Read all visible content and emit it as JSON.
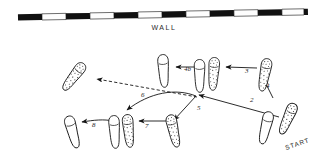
{
  "figure": {
    "title_text": "WALL",
    "start_text": "START",
    "background_color": "#ffffff",
    "ink_color": "#141414"
  },
  "wall": {
    "label": "WALL",
    "segment_count": 12,
    "pattern": [
      "dark",
      "light",
      "dark",
      "light",
      "dark",
      "light",
      "dark",
      "light",
      "dark",
      "light",
      "dark",
      "light"
    ],
    "dark_color": "#111111",
    "light_color": "#fdfdfd"
  },
  "footprints": [
    {
      "id": "start-right",
      "label": "START",
      "side": "right",
      "shading": "stippled",
      "x": 286,
      "y": 118,
      "rotation": 22
    },
    {
      "id": "foot-step1-left",
      "label": "1",
      "side": "left",
      "shading": "plain",
      "x": 265,
      "y": 127,
      "rotation": 14
    },
    {
      "id": "foot-step2-right",
      "label": "2",
      "side": "right",
      "shading": "stippled",
      "x": 264,
      "y": 74,
      "rotation": 10
    },
    {
      "id": "foot-step3-right",
      "label": "3",
      "side": "right",
      "shading": "stippled",
      "x": 213,
      "y": 73,
      "rotation": 2
    },
    {
      "id": "foot-step3-left",
      "label": "3b",
      "side": "left",
      "shading": "plain",
      "x": 199,
      "y": 75,
      "rotation": -2
    },
    {
      "id": "foot-step4-left",
      "label": "4",
      "side": "left",
      "shading": "plain",
      "x": 163,
      "y": 70,
      "rotation": -6
    },
    {
      "id": "foot-step5-right",
      "label": "5",
      "side": "right",
      "shading": "stippled",
      "x": 172,
      "y": 128,
      "rotation": -16
    },
    {
      "id": "foot-step6-right",
      "label": "6",
      "side": "right",
      "shading": "stippled",
      "x": 128,
      "y": 128,
      "rotation": -8
    },
    {
      "id": "foot-step7-left",
      "label": "7",
      "side": "left",
      "shading": "plain",
      "x": 114,
      "y": 130,
      "rotation": -6
    },
    {
      "id": "foot-step8-left",
      "label": "8",
      "side": "left",
      "shading": "plain",
      "x": 72,
      "y": 130,
      "rotation": -18
    },
    {
      "id": "foot-final-left",
      "label": "final",
      "side": "left",
      "shading": "stippled",
      "x": 72,
      "y": 76,
      "rotation": 36
    }
  ],
  "step_labels": [
    {
      "n": "2",
      "x": 250,
      "y": 101
    },
    {
      "n": "3",
      "x": 246,
      "y": 72
    },
    {
      "n": "4",
      "x": 265,
      "y": 86
    },
    {
      "n": "4b",
      "x": 184,
      "y": 70
    },
    {
      "n": "5",
      "x": 198,
      "y": 108
    },
    {
      "n": "6",
      "x": 141,
      "y": 95
    },
    {
      "n": "7",
      "x": 144,
      "y": 127
    },
    {
      "n": "8",
      "x": 92,
      "y": 125
    }
  ],
  "arrows": [
    {
      "id": "arrow-start-to-2",
      "number": "2",
      "style": "solid",
      "from": [
        278,
        118
      ],
      "to": [
        196,
        94
      ]
    },
    {
      "id": "arrow-2-to-3",
      "number": "3",
      "style": "solid",
      "from": [
        256,
        69
      ],
      "to": [
        224,
        68
      ]
    },
    {
      "id": "arrow-3-to-4",
      "number": "4",
      "style": "solid",
      "from": [
        272,
        96
      ],
      "to": [
        262,
        78
      ]
    },
    {
      "id": "arrow-4-to-5",
      "number": "4b",
      "style": "solid",
      "from": [
        196,
        68
      ],
      "to": [
        174,
        68
      ]
    },
    {
      "id": "arrow-5-to-6",
      "number": "5",
      "style": "solid",
      "from": [
        196,
        94
      ],
      "to": [
        172,
        120
      ]
    },
    {
      "id": "arrow-6-to-7",
      "number": "6",
      "style": "solid",
      "from": [
        196,
        94
      ],
      "to": [
        124,
        112
      ]
    },
    {
      "id": "arrow-7-to-8",
      "number": "7",
      "style": "solid",
      "from": [
        170,
        122
      ],
      "to": [
        136,
        122
      ]
    },
    {
      "id": "arrow-8-to-final",
      "number": "8",
      "style": "solid",
      "from": [
        112,
        122
      ],
      "to": [
        78,
        122
      ]
    },
    {
      "id": "arrow-final-dashed",
      "number": "",
      "style": "dashed",
      "from": [
        196,
        96
      ],
      "to": [
        94,
        78
      ]
    }
  ]
}
